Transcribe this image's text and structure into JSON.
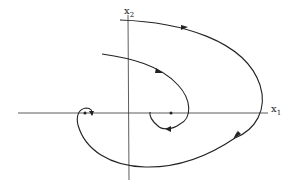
{
  "diagram": {
    "type": "phase-portrait",
    "axes": {
      "x_label": "x",
      "x_subscript": "1",
      "y_label": "x",
      "y_subscript": "2"
    },
    "equilibria": [
      {
        "name": "left-equilibrium",
        "x": 85,
        "y": 113
      },
      {
        "name": "right-equilibrium",
        "x": 171,
        "y": 113
      }
    ],
    "trajectories": [
      {
        "name": "outer-trajectory",
        "description": "from top near x2 axis, curving right, crossing x1 axis, sweeping below and spiraling into left equilibrium"
      },
      {
        "name": "inner-trajectory",
        "description": "from upper left, curving right and down, spiraling around right equilibrium"
      }
    ],
    "stroke_color": "#222222",
    "background": "#ffffff"
  }
}
